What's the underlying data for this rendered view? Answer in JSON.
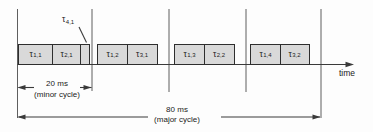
{
  "colors": {
    "background": "#fdfdfd",
    "box_fill": "#d9d9d9",
    "box_border": "#2e2e2e",
    "line": "#3a3a3a",
    "divider": "#5f5f5f",
    "text": "#222222"
  },
  "axis": {
    "label": "time"
  },
  "callout": {
    "symbol": "τ",
    "index": "4,1"
  },
  "tasks": [
    {
      "symbol": "τ",
      "index": "1,1"
    },
    {
      "symbol": "τ",
      "index": "2,1"
    },
    {
      "symbol": "τ",
      "index": "1,2"
    },
    {
      "symbol": "τ",
      "index": "3,1"
    },
    {
      "symbol": "τ",
      "index": "1,3"
    },
    {
      "symbol": "τ",
      "index": "2,2"
    },
    {
      "symbol": "τ",
      "index": "1,4"
    },
    {
      "symbol": "τ",
      "index": "3,2"
    }
  ],
  "dimensions": {
    "minor": {
      "duration": "20 ms",
      "label": "(minor cycle)"
    },
    "major": {
      "duration": "80 ms",
      "label": "(major cycle)"
    }
  }
}
